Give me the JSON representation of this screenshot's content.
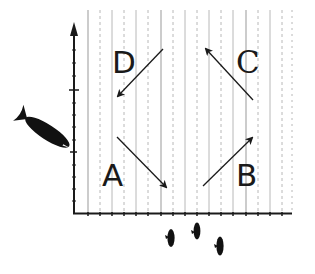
{
  "diagram": {
    "type": "quadrant-motion-diagram",
    "colors": {
      "background": "#ffffff",
      "ink": "#1a1a1a",
      "grid": "#b8b8b8"
    },
    "axes": {
      "y_axis": {
        "has_arrow": true,
        "major_ticks": 2
      },
      "x_axis": {
        "has_arrow": false,
        "tick_count": 18
      }
    },
    "quadrants": [
      {
        "id": "A",
        "label": "A",
        "position": "bottom-left",
        "arrow_direction": "down-right"
      },
      {
        "id": "B",
        "label": "B",
        "position": "bottom-right",
        "arrow_direction": "up-right"
      },
      {
        "id": "C",
        "label": "C",
        "position": "top-right",
        "arrow_direction": "up-left"
      },
      {
        "id": "D",
        "label": "D",
        "position": "top-left",
        "arrow_direction": "down-left"
      }
    ],
    "icons": {
      "large_fish": "fish-icon",
      "small_fish": [
        "fish-icon",
        "fish-icon",
        "fish-icon"
      ]
    }
  }
}
